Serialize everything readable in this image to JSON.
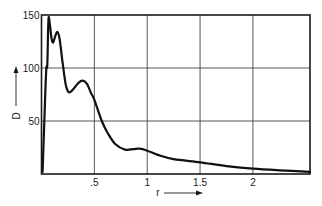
{
  "chart_data": {
    "type": "line",
    "title": "",
    "xlabel": "r",
    "ylabel": "D",
    "xlim": [
      0,
      2.54
    ],
    "ylim": [
      0,
      150
    ],
    "grid": true,
    "legend": null,
    "x_ticks": [
      {
        "value": 0.5,
        "label": ".5"
      },
      {
        "value": 1,
        "label": "1"
      },
      {
        "value": 1.5,
        "label": "1.5"
      },
      {
        "value": 2,
        "label": "2"
      }
    ],
    "y_ticks": [
      {
        "value": 50,
        "label": "50"
      },
      {
        "value": 100,
        "label": "100"
      },
      {
        "value": 150,
        "label": "150"
      }
    ],
    "series": [
      {
        "name": "D(r)",
        "x": [
          0.01,
          0.03,
          0.045,
          0.055,
          0.066,
          0.08,
          0.095,
          0.11,
          0.13,
          0.15,
          0.17,
          0.2,
          0.23,
          0.26,
          0.3,
          0.35,
          0.39,
          0.43,
          0.47,
          0.5,
          0.57,
          0.63,
          0.7,
          0.79,
          0.87,
          0.93,
          1.0,
          1.1,
          1.25,
          1.5,
          1.75,
          2.0,
          2.25,
          2.54
        ],
        "y": [
          2,
          60,
          99,
          103,
          146,
          140,
          128,
          124,
          130,
          134,
          128,
          105,
          84,
          77,
          80,
          86,
          88,
          85,
          76,
          70,
          50,
          38,
          28,
          23,
          23.5,
          24,
          22,
          18,
          14,
          11,
          7.5,
          5,
          3.5,
          2
        ]
      }
    ],
    "annotations": [
      {
        "text": "D",
        "arrow": "up",
        "position": "left of y-axis"
      },
      {
        "text": "r",
        "arrow": "right",
        "position": "below x-axis"
      }
    ]
  },
  "labels": {
    "x_axis": "r",
    "y_axis": "D"
  }
}
